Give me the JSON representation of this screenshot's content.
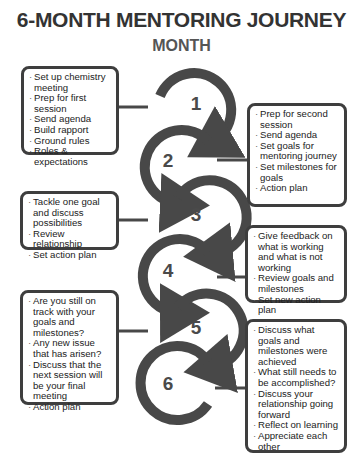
{
  "title": "6-MONTH MENTORING JOURNEY",
  "subtitle": "MONTH",
  "colors": {
    "arc": "#484848",
    "border": "#3e3e3e",
    "text": "#222222"
  },
  "months": [
    {
      "number": "1",
      "items": [
        "Set up chemistry meeting",
        "Prep for first session",
        "Send agenda",
        "Build rapport",
        "Ground rules",
        "Roles & expectations"
      ]
    },
    {
      "number": "2",
      "items": [
        "Prep for second session",
        "Send agenda",
        "Set goals for mentoring journey",
        "Set milestones for goals",
        "Action plan"
      ]
    },
    {
      "number": "3",
      "items": [
        "Tackle one goal and discuss possibilities",
        "Review relationship",
        "Set action plan"
      ]
    },
    {
      "number": "4",
      "items": [
        "Give feedback on what is working and what is not working",
        "Review goals and milestones",
        "Set new action plan"
      ]
    },
    {
      "number": "5",
      "items": [
        "Are you still on track with your goals and milestones?",
        "Any new issue that has arisen?",
        "Discuss that the next session will be your final meeting",
        "Action plan"
      ]
    },
    {
      "number": "6",
      "items": [
        "Discuss what goals and milestones were achieved",
        "What still needs to be accomplished?",
        "Discuss your relationship going forward",
        "Reflect on learning",
        "Appreciate each other"
      ]
    }
  ]
}
